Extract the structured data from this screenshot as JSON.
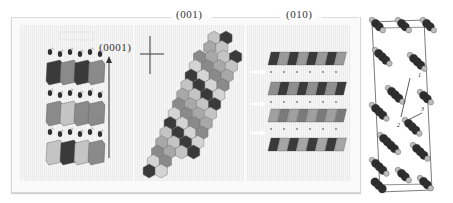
{
  "figure": {
    "panels": [
      {
        "id": "a",
        "label": "(0001)",
        "description": "layered polyhedra stacked along c-axis with adsorbed species"
      },
      {
        "id": "b",
        "label": "(001)",
        "description": "hexagonal polyhedral sheet viewed along c"
      },
      {
        "id": "c",
        "label": "(010)",
        "description": "layered slabs with arrows marking interlayer planes"
      }
    ],
    "ball_and_stick": {
      "description": "unit cell ball-and-stick model with migration paths",
      "path_labels": [
        "1",
        "2",
        "3"
      ]
    },
    "colors": {
      "dark_polyhedron": "#3a3a3a",
      "mid_polyhedron": "#8a8a8a",
      "light_polyhedron": "#c4c4c4",
      "atom_dark": "#2e2e2e",
      "atom_light": "#bdbdbd"
    }
  }
}
